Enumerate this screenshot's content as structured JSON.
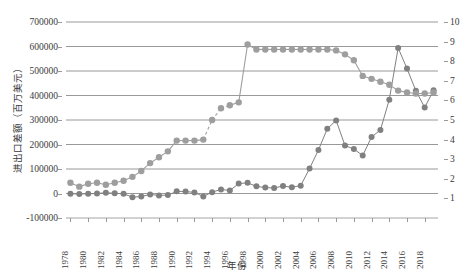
{
  "chart_data": {
    "type": "line",
    "title": "",
    "xlabel": "年份",
    "ylabel": "进出口差额（百万美元）",
    "ylabel_right": "",
    "grid": true,
    "legend": "none",
    "ylim": [
      -100000,
      700000
    ],
    "ylim_right": [
      0,
      10
    ],
    "yticks": [
      -100000,
      0,
      100000,
      200000,
      300000,
      400000,
      500000,
      600000,
      700000
    ],
    "yticks_right": [
      1,
      2,
      3,
      4,
      5,
      6,
      7,
      8,
      9,
      10
    ],
    "xtick_labels": [
      "1978",
      "1980",
      "1982",
      "1984",
      "1986",
      "1988",
      "1990",
      "1992",
      "1994",
      "1996",
      "1998",
      "2000",
      "2002",
      "2004",
      "2006",
      "2008",
      "2010",
      "2012",
      "2014",
      "2016",
      "2018"
    ],
    "x": [
      1978,
      1979,
      1980,
      1981,
      1982,
      1983,
      1984,
      1985,
      1986,
      1987,
      1988,
      1989,
      1990,
      1991,
      1992,
      1993,
      1994,
      1995,
      1996,
      1997,
      1998,
      1999,
      2000,
      2001,
      2002,
      2003,
      2004,
      2005,
      2006,
      2007,
      2008,
      2009,
      2010,
      2011,
      2012,
      2013,
      2014,
      2015,
      2016,
      2017,
      2018,
      2019
    ],
    "series": [
      {
        "name": "进出口差额",
        "axis": "left",
        "color": "#808080",
        "marker": "circle",
        "values": [
          -1140,
          -2010,
          -1280,
          -10,
          3040,
          840,
          -1270,
          -14900,
          -11970,
          -3770,
          -7750,
          -6600,
          8740,
          8120,
          4350,
          -12220,
          5390,
          16700,
          12220,
          40420,
          43470,
          29230,
          24110,
          22550,
          30430,
          25470,
          32090,
          102000,
          177500,
          264300,
          298100,
          195700,
          181500,
          155100,
          230700,
          259200,
          383100,
          594200,
          509700,
          419600,
          350900,
          421500
        ]
      },
      {
        "name": "进出口总额占比",
        "axis": "right",
        "color": "#9e9e9e",
        "marker": "circle",
        "values": [
          1.8,
          1.6,
          1.75,
          1.8,
          1.7,
          1.8,
          1.9,
          2.1,
          2.4,
          2.8,
          3.1,
          3.4,
          3.95,
          3.95,
          3.95,
          4.0,
          5.0,
          5.6,
          5.75,
          5.9,
          8.85,
          8.6,
          8.6,
          8.6,
          8.6,
          8.6,
          8.6,
          8.6,
          8.6,
          8.6,
          8.55,
          8.35,
          8.05,
          7.25,
          7.1,
          6.95,
          6.8,
          6.5,
          6.4,
          6.35,
          6.35,
          6.4
        ]
      }
    ],
    "dashed_segment_series2": {
      "from_index": 15,
      "to_index": 18
    }
  },
  "axis": {
    "left_ticks": [
      "700000",
      "600000",
      "500000",
      "400000",
      "300000",
      "200000",
      "100000",
      "0",
      "-100000"
    ],
    "right_ticks": [
      "10",
      "9",
      "8",
      "7",
      "6",
      "5",
      "4",
      "3",
      "2",
      "1"
    ],
    "y_title": "进出口差额（百万美元）",
    "x_title": "年份"
  }
}
